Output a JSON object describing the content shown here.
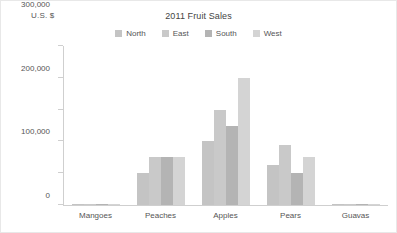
{
  "chart_data": {
    "type": "bar",
    "title": "2011 Fruit Sales",
    "xlabel": "",
    "ylabel": "U.S. $",
    "ylim": [
      0,
      500000
    ],
    "ytick_labels": [
      "0",
      "100,000",
      "200,000",
      "300,000",
      "400,000",
      "500,000"
    ],
    "yticks": [
      0,
      100000,
      200000,
      300000,
      400000,
      500000
    ],
    "grid": false,
    "legend_position": "top-center",
    "categories": [
      "Mangoes",
      "Peaches",
      "Apples",
      "Pears",
      "Guavas"
    ],
    "series": [
      {
        "name": "North",
        "color": "#c4c4c4",
        "values": [
          1500,
          100000,
          200000,
          125000,
          1200
        ]
      },
      {
        "name": "East",
        "color": "#c9c9c9",
        "values": [
          2500,
          150000,
          300000,
          190000,
          1500
        ]
      },
      {
        "name": "South",
        "color": "#b4b4b4",
        "values": [
          2000,
          150000,
          250000,
          100000,
          1000
        ]
      },
      {
        "name": "West",
        "color": "#d4d4d4",
        "values": [
          1800,
          150000,
          400000,
          150000,
          1300
        ]
      }
    ]
  },
  "colors": {
    "axis": "#cfcfcf",
    "text": "#555555",
    "title": "#444444",
    "background": "#ffffff",
    "frame": "#e8e8e8"
  }
}
